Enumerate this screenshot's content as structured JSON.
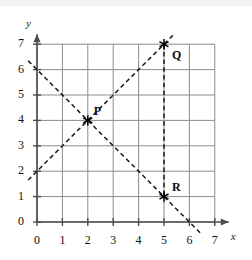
{
  "figure": {
    "title": "",
    "background_color": "#ffffff",
    "grid_color": "#8c8c8c",
    "axis_color": "#4d4d4d",
    "line_color": "#1a1a1a",
    "marker_color": "#000000"
  },
  "axes": {
    "x_axis_label": "x",
    "y_axis_label": "y",
    "x_ticks": [
      "0",
      "1",
      "2",
      "3",
      "4",
      "5",
      "6",
      "7"
    ],
    "y_ticks": [
      "0",
      "1",
      "2",
      "3",
      "4",
      "5",
      "6",
      "7"
    ],
    "xlim": [
      0,
      7
    ],
    "ylim": [
      0,
      7
    ],
    "grid": true,
    "x_arrow": true,
    "y_arrow": true
  },
  "chart_data": {
    "type": "scatter",
    "title": "",
    "xlabel": "x",
    "ylabel": "y",
    "xlim": [
      0,
      7
    ],
    "ylim": [
      0,
      7
    ],
    "grid": true,
    "legend": "none",
    "x_ticks": [
      0,
      1,
      2,
      3,
      4,
      5,
      6,
      7
    ],
    "y_ticks": [
      0,
      1,
      2,
      3,
      4,
      5,
      6,
      7
    ],
    "points": [
      {
        "label": "P",
        "x": 2,
        "y": 4,
        "marker": "asterisk",
        "label_dx": 6,
        "label_dy": -16
      },
      {
        "label": "Q",
        "x": 5,
        "y": 7,
        "marker": "asterisk",
        "label_dx": 8,
        "label_dy": 4
      },
      {
        "label": "R",
        "x": 5,
        "y": 1,
        "marker": "asterisk",
        "label_dx": 8,
        "label_dy": -17
      }
    ],
    "series": [
      {
        "name": "ascending-line",
        "type": "line",
        "style": "dashed",
        "equation": "y = x + 2",
        "slope": 1,
        "intercept": 2,
        "x_start": -0.35,
        "y_start": 1.65,
        "x_end": 5.35,
        "y_end": 7.35,
        "passes_through": [
          [
            2,
            4
          ],
          [
            5,
            7
          ]
        ]
      },
      {
        "name": "descending-line",
        "type": "line",
        "style": "dashed",
        "equation": "y = -x + 6",
        "slope": -1,
        "intercept": 6,
        "x_start": -0.35,
        "y_start": 6.35,
        "x_end": 6.45,
        "y_end": -0.45,
        "passes_through": [
          [
            2,
            4
          ],
          [
            5,
            1
          ]
        ]
      },
      {
        "name": "vertical-segment-QR",
        "type": "line",
        "style": "dashed",
        "equation": "x = 5",
        "x_start": 5,
        "y_start": 7,
        "x_end": 5,
        "y_end": 1,
        "passes_through": [
          [
            5,
            7
          ],
          [
            5,
            1
          ]
        ]
      }
    ]
  }
}
